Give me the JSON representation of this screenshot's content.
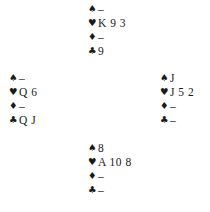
{
  "diagram": {
    "suit_symbols": {
      "spades": "♠",
      "hearts": "♥",
      "diamonds": "♦",
      "clubs": "♣"
    },
    "hands": {
      "north": {
        "spades": "–",
        "hearts": "K 9 3",
        "diamonds": "–",
        "clubs": "9"
      },
      "west": {
        "spades": "–",
        "hearts": "Q 6",
        "diamonds": "–",
        "clubs": "Q J"
      },
      "east": {
        "spades": "J",
        "hearts": "J 5 2",
        "diamonds": "–",
        "clubs": "–"
      },
      "south": {
        "spades": "8",
        "hearts": "A 10 8",
        "diamonds": "–",
        "clubs": "–"
      }
    }
  }
}
